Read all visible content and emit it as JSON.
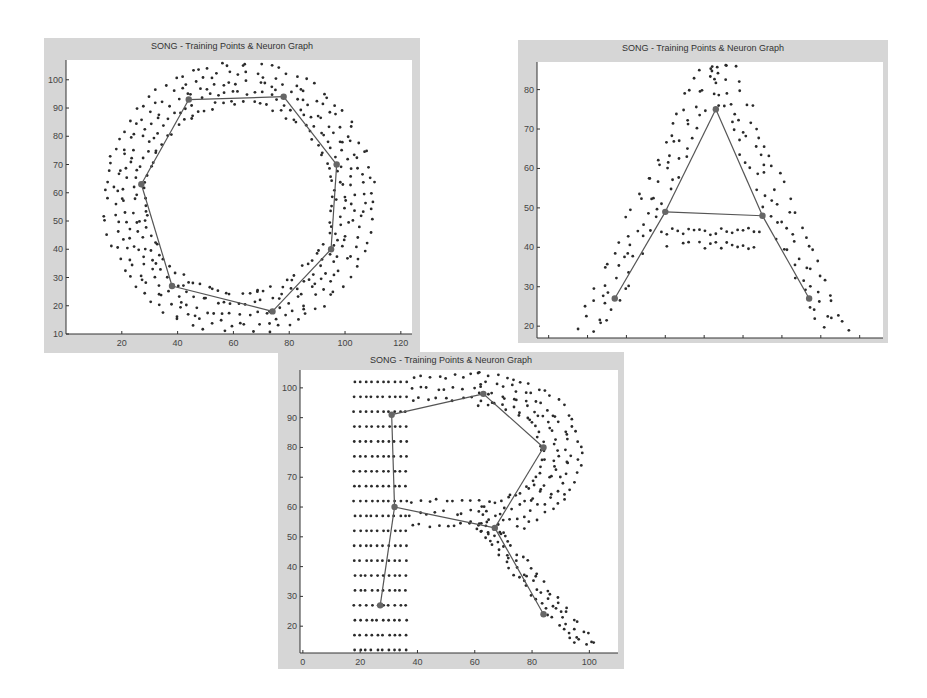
{
  "chart_data": [
    {
      "type": "scatter",
      "id": "O",
      "title": "SONG - Training Points & Neuron Graph",
      "xlabel": "",
      "ylabel": "",
      "xlim": [
        0,
        124
      ],
      "ylim": [
        10,
        107
      ],
      "xticks": [
        20,
        40,
        60,
        80,
        100,
        120
      ],
      "yticks": [
        10,
        20,
        30,
        40,
        50,
        60,
        70,
        80,
        90,
        100
      ],
      "grid": false,
      "shape": "ring",
      "ring": {
        "cx": 62,
        "cy": 58,
        "r_inner": 34,
        "r_outer": 48
      },
      "neurons": [
        [
          44,
          93
        ],
        [
          78,
          94
        ],
        [
          97,
          70
        ],
        [
          95,
          40
        ],
        [
          74,
          18
        ],
        [
          38,
          27
        ],
        [
          27,
          63
        ]
      ],
      "edges": [
        [
          0,
          1
        ],
        [
          1,
          2
        ],
        [
          2,
          3
        ],
        [
          3,
          4
        ],
        [
          4,
          5
        ],
        [
          5,
          6
        ],
        [
          6,
          0
        ]
      ]
    },
    {
      "type": "scatter",
      "id": "A",
      "title": "SONG - Training Points & Neuron Graph",
      "xlabel": "",
      "ylabel": "",
      "xlim": [
        -3,
        86
      ],
      "ylim": [
        17,
        87
      ],
      "xticks": [
        0,
        10,
        20,
        30,
        40,
        50,
        60,
        70,
        80
      ],
      "yticks": [
        20,
        30,
        40,
        50,
        60,
        70,
        80
      ],
      "grid": false,
      "shape": "letter-A",
      "neurons": [
        [
          17,
          27
        ],
        [
          30,
          49
        ],
        [
          43,
          75
        ],
        [
          55,
          48
        ],
        [
          67,
          27
        ]
      ],
      "edges": [
        [
          0,
          1
        ],
        [
          1,
          2
        ],
        [
          2,
          3
        ],
        [
          3,
          4
        ],
        [
          1,
          3
        ]
      ]
    },
    {
      "type": "scatter",
      "id": "R",
      "title": "SONG - Training Points & Neuron Graph",
      "xlabel": "",
      "ylabel": "",
      "xlim": [
        -1,
        110
      ],
      "ylim": [
        11,
        106
      ],
      "xticks": [
        0,
        20,
        40,
        60,
        80,
        100
      ],
      "yticks": [
        20,
        30,
        40,
        50,
        60,
        70,
        80,
        90,
        100
      ],
      "grid": false,
      "shape": "letter-R",
      "neurons": [
        [
          27,
          27
        ],
        [
          32,
          60
        ],
        [
          31,
          91
        ],
        [
          63,
          98
        ],
        [
          84,
          80
        ],
        [
          67,
          53
        ],
        [
          84,
          24
        ]
      ],
      "edges": [
        [
          0,
          1
        ],
        [
          1,
          2
        ],
        [
          2,
          3
        ],
        [
          3,
          4
        ],
        [
          4,
          5
        ],
        [
          5,
          1
        ],
        [
          5,
          6
        ]
      ]
    }
  ],
  "figures": [
    {
      "title": "SONG - Training Points & Neuron Graph"
    },
    {
      "title": "SONG - Training Points & Neuron Graph"
    },
    {
      "title": "SONG - Training Points & Neuron Graph"
    }
  ]
}
